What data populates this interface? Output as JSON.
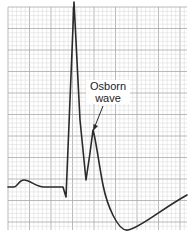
{
  "figure": {
    "type": "ecg_strip",
    "annotation": {
      "line1": "Osborn",
      "line2": "wave"
    },
    "colors": {
      "background": "#ffffff",
      "grid_minor": "#d6d6d6",
      "grid_major": "#a8a8a8",
      "trace": "#2a2a2a",
      "text": "#222222"
    },
    "grid": {
      "x0": 8,
      "y0": 7,
      "x1": 187,
      "y1": 230,
      "minor_step": 4.3,
      "major_every": 5
    },
    "waveform_segments": [
      "baseline",
      "P wave",
      "PR segment",
      "Q dip",
      "R wave (tall spike)",
      "S wave",
      "Osborn (J) wave",
      "ST depression / T wave trough",
      "recovery toward baseline"
    ]
  }
}
